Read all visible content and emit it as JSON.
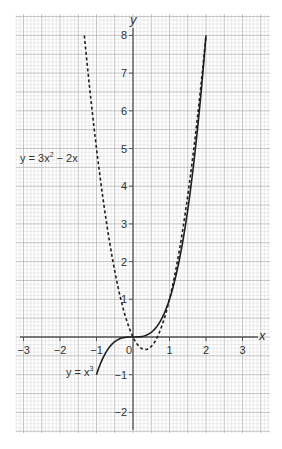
{
  "chart_data": {
    "type": "line",
    "title": "",
    "xlabel": "x",
    "ylabel": "y",
    "xlim": [
      -3.2,
      3.7
    ],
    "ylim": [
      -2.6,
      8.5
    ],
    "grid": true,
    "x_ticks": [
      -3,
      -2,
      -1,
      0,
      1,
      2,
      3
    ],
    "y_ticks": [
      -2,
      -1,
      1,
      2,
      3,
      4,
      5,
      6,
      7,
      8
    ],
    "x_tick_labels": [
      "−3",
      "−2",
      "−1",
      "0",
      "1",
      "2",
      "3"
    ],
    "y_tick_labels": [
      "−2",
      "−1",
      "1",
      "2",
      "3",
      "4",
      "5",
      "6",
      "7",
      "8"
    ],
    "series": [
      {
        "name": "y = x³",
        "expression": "x^3",
        "style": "solid",
        "x_range": [
          -1,
          2
        ],
        "points": [
          [
            -1,
            -1
          ],
          [
            -0.5,
            -0.125
          ],
          [
            0,
            0
          ],
          [
            0.5,
            0.125
          ],
          [
            1,
            1
          ],
          [
            1.5,
            3.375
          ],
          [
            2,
            8
          ]
        ]
      },
      {
        "name": "y = 3x² − 2x",
        "expression": "3x^2 - 2x",
        "style": "dashed",
        "x_range": [
          -1.333,
          2
        ],
        "points": [
          [
            -1.333,
            8
          ],
          [
            -1,
            5
          ],
          [
            -0.5,
            1.75
          ],
          [
            0,
            0
          ],
          [
            0.333,
            -0.333
          ],
          [
            0.667,
            0
          ],
          [
            1,
            1
          ],
          [
            1.5,
            3.75
          ],
          [
            2,
            8
          ]
        ]
      }
    ],
    "annotations": [
      {
        "text_prefix": "y = x",
        "superscript": "3",
        "target_series": 0,
        "position": [
          -1.8,
          -1.5
        ]
      },
      {
        "text_prefix": "y = 3x",
        "superscript": "2",
        "text_suffix": " − 2x",
        "target_series": 1,
        "position": [
          -2.55,
          4.9
        ]
      }
    ]
  },
  "labels": {
    "x_axis": "x",
    "y_axis": "y",
    "cubic_prefix": "y = x",
    "cubic_sup": "3",
    "quad_prefix": "y = 3x",
    "quad_sup": "2",
    "quad_suffix": " − 2x"
  },
  "colors": {
    "background": "#ffffff",
    "grid_minor": "#d9d9d9",
    "grid_major": "#b5b5b5",
    "axis": "#555555",
    "curve": "#1e1e1e",
    "text": "#333333"
  }
}
